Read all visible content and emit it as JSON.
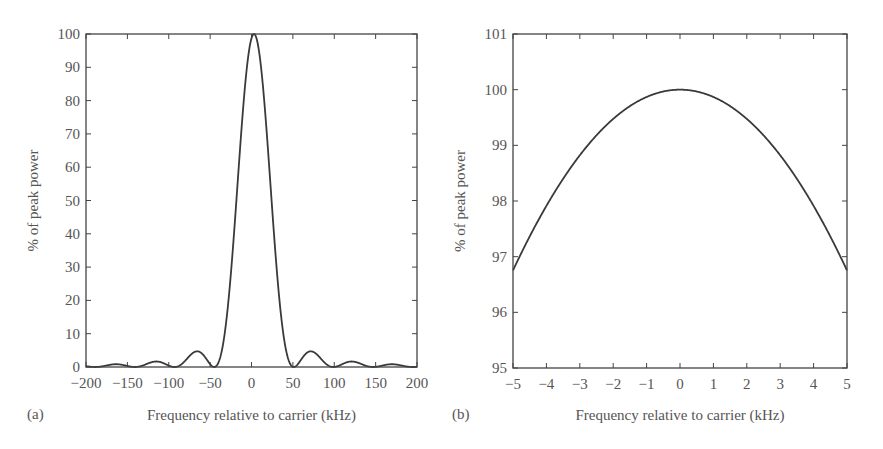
{
  "chart_data": [
    {
      "panel_label": "(a)",
      "type": "line",
      "title": "",
      "xlabel": "Frequency relative to carrier (kHz)",
      "ylabel": "% of peak power",
      "xlim": [
        -200,
        200
      ],
      "ylim": [
        0,
        100
      ],
      "xticks": [
        -200,
        -150,
        -100,
        -50,
        0,
        50,
        100,
        150,
        200
      ],
      "xtick_labels": [
        "−200",
        "−150",
        "−100",
        "−50",
        "0",
        "50",
        "100",
        "150",
        "200"
      ],
      "yticks": [
        0,
        10,
        20,
        30,
        40,
        50,
        60,
        70,
        80,
        90,
        100
      ],
      "ytick_labels": [
        "0",
        "10",
        "20",
        "30",
        "40",
        "50",
        "60",
        "70",
        "80",
        "90",
        "100"
      ],
      "grid": false,
      "legend": null,
      "curve": "sinc-squared power spectrum",
      "x": [
        -200,
        -195,
        -180,
        -170,
        -145,
        -120,
        -95,
        -70,
        -45,
        -40,
        -30,
        -20,
        -10,
        0,
        3,
        10,
        20,
        30,
        40,
        48,
        50,
        75,
        97,
        125,
        147,
        175,
        195,
        200
      ],
      "series": [
        {
          "name": "power",
          "values": [
            0.1,
            0,
            0.6,
            0.8,
            0,
            1.6,
            0,
            4.5,
            0,
            1.5,
            12,
            35,
            70,
            96,
            100,
            96,
            75,
            45,
            15,
            0.5,
            0,
            4.5,
            0,
            1.6,
            0,
            0.8,
            0,
            0.1
          ]
        }
      ],
      "model": {
        "center_khz": 3,
        "null_spacing_khz": 48
      }
    },
    {
      "panel_label": "(b)",
      "type": "line",
      "title": "",
      "xlabel": "Frequency relative to carrier (kHz)",
      "ylabel": "% of peak power",
      "xlim": [
        -5,
        5
      ],
      "ylim": [
        95,
        101
      ],
      "xticks": [
        -5,
        -4,
        -3,
        -2,
        -1,
        0,
        1,
        2,
        3,
        4,
        5
      ],
      "xtick_labels": [
        "−5",
        "−4",
        "−3",
        "−2",
        "−1",
        "0",
        "1",
        "2",
        "3",
        "4",
        "5"
      ],
      "yticks": [
        95,
        96,
        97,
        98,
        99,
        100,
        101
      ],
      "ytick_labels": [
        "95",
        "96",
        "97",
        "98",
        "99",
        "100",
        "101"
      ],
      "grid": false,
      "legend": null,
      "curve": "top of main lobe (parabolic)",
      "x": [
        -5,
        -4,
        -3,
        -2,
        -1,
        0,
        1,
        2,
        3,
        4,
        5
      ],
      "series": [
        {
          "name": "power",
          "values": [
            96.75,
            97.9,
            98.8,
            99.48,
            99.87,
            100.0,
            99.87,
            99.48,
            98.8,
            97.9,
            96.75
          ]
        }
      ],
      "model": {
        "center_khz": 0,
        "null_spacing_khz": 50
      }
    }
  ]
}
